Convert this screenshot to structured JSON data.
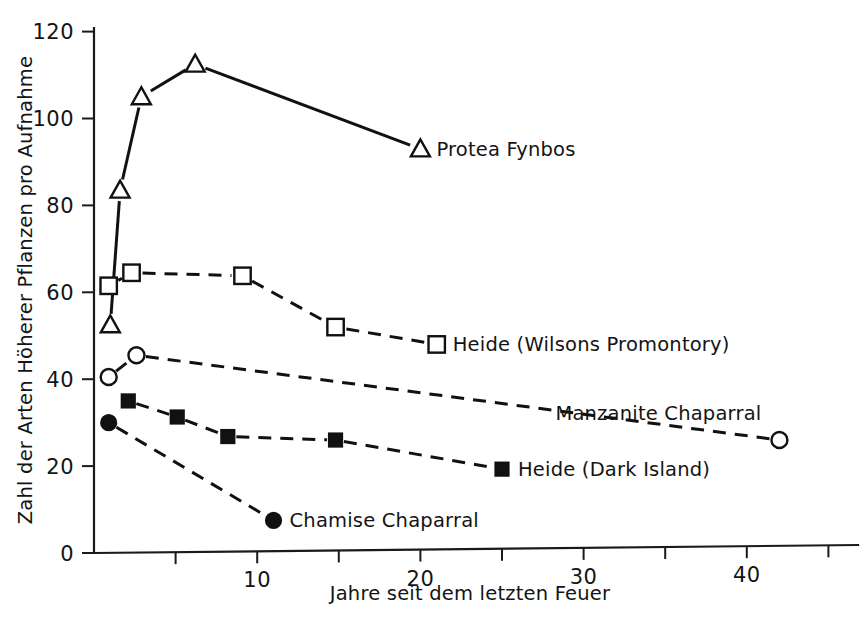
{
  "chart_data": {
    "type": "line",
    "title": "",
    "subtitle": "",
    "xlabel": "Jahre seit dem letzten Feuer",
    "ylabel": "Zahl der Arten Höherer Pflanzen pro Aufnahme",
    "xlim": [
      0,
      46
    ],
    "ylim": [
      0,
      124
    ],
    "grid": false,
    "legend_position": "inline-right-of-last-point",
    "x_ticks": [
      {
        "value": 5,
        "label": ""
      },
      {
        "value": 10,
        "label": "10"
      },
      {
        "value": 15,
        "label": ""
      },
      {
        "value": 20,
        "label": "20"
      },
      {
        "value": 25,
        "label": ""
      },
      {
        "value": 30,
        "label": "30"
      },
      {
        "value": 35,
        "label": ""
      },
      {
        "value": 40,
        "label": "40"
      },
      {
        "value": 45,
        "label": ""
      }
    ],
    "y_ticks": [
      {
        "value": 0,
        "label": "0"
      },
      {
        "value": 20,
        "label": "20"
      },
      {
        "value": 40,
        "label": "40"
      },
      {
        "value": 60,
        "label": "60"
      },
      {
        "value": 80,
        "label": "80"
      },
      {
        "value": 100,
        "label": "100"
      },
      {
        "value": 120,
        "label": "120"
      }
    ],
    "series": [
      {
        "name": "Protea Fynbos",
        "marker": "open-triangle",
        "linestyle": "solid",
        "color": "#111111",
        "label_position": "right",
        "points": [
          {
            "x": 1.0,
            "y": 52.5
          },
          {
            "x": 1.6,
            "y": 83.5
          },
          {
            "x": 2.9,
            "y": 105.0
          },
          {
            "x": 6.2,
            "y": 112.5
          },
          {
            "x": 20.0,
            "y": 93.0
          }
        ]
      },
      {
        "name": "Heide (Wilsons Promontory)",
        "marker": "open-square",
        "linestyle": "dashed",
        "color": "#111111",
        "label_position": "right",
        "points": [
          {
            "x": 0.9,
            "y": 61.5
          },
          {
            "x": 2.3,
            "y": 64.5
          },
          {
            "x": 9.1,
            "y": 63.8
          },
          {
            "x": 14.8,
            "y": 52.0
          },
          {
            "x": 21.0,
            "y": 48.0
          }
        ]
      },
      {
        "name": "Manzanite Chaparral",
        "marker": "open-circle",
        "linestyle": "dashed",
        "color": "#111111",
        "label_position": "above-left",
        "points": [
          {
            "x": 0.9,
            "y": 40.5
          },
          {
            "x": 2.6,
            "y": 45.5
          },
          {
            "x": 42.0,
            "y": 26.0
          }
        ]
      },
      {
        "name": "Heide (Dark Island)",
        "marker": "filled-square",
        "linestyle": "dashed",
        "color": "#111111",
        "label_position": "right",
        "points": [
          {
            "x": 2.1,
            "y": 35.0
          },
          {
            "x": 5.1,
            "y": 31.3
          },
          {
            "x": 8.2,
            "y": 26.8
          },
          {
            "x": 14.8,
            "y": 26.0
          },
          {
            "x": 25.0,
            "y": 19.3
          }
        ]
      },
      {
        "name": "Chamise Chaparral",
        "marker": "filled-circle",
        "linestyle": "dashed",
        "color": "#111111",
        "label_position": "right",
        "points": [
          {
            "x": 0.9,
            "y": 30.0
          },
          {
            "x": 11.0,
            "y": 7.5
          }
        ]
      }
    ]
  }
}
